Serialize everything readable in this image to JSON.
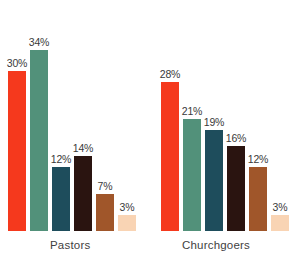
{
  "chart_data": {
    "type": "bar",
    "title": "",
    "subtitle": "",
    "xlabel": "",
    "ylabel": "",
    "ylim": [
      0,
      36
    ],
    "grid": false,
    "legend": "none",
    "categories": [
      "Pastors",
      "Churchgoers"
    ],
    "series": [
      {
        "name": "Series 1",
        "color": "#F5391D",
        "values": [
          30,
          28
        ],
        "labels": [
          "30%",
          "28%"
        ]
      },
      {
        "name": "Series 2",
        "color": "#52917A",
        "values": [
          34,
          21
        ],
        "labels": [
          "34%",
          "21%"
        ]
      },
      {
        "name": "Series 3",
        "color": "#1E4D5C",
        "values": [
          12,
          19
        ],
        "labels": [
          "12%",
          "19%"
        ]
      },
      {
        "name": "Series 4",
        "color": "#2A1410",
        "values": [
          14,
          16
        ],
        "labels": [
          "14%",
          "16%"
        ]
      },
      {
        "name": "Series 5",
        "color": "#A0562A",
        "values": [
          7,
          12
        ],
        "labels": [
          "7%",
          "12%"
        ]
      },
      {
        "name": "Series 6",
        "color": "#F9D4B4",
        "values": [
          3,
          3
        ],
        "labels": [
          "3%",
          "3%"
        ]
      }
    ],
    "groups": [
      {
        "label": "Pastors",
        "bars": [
          {
            "label": "30%",
            "value": 30,
            "color": "#F5391D"
          },
          {
            "label": "34%",
            "value": 34,
            "color": "#52917A"
          },
          {
            "label": "12%",
            "value": 12,
            "color": "#1E4D5C"
          },
          {
            "label": "14%",
            "value": 14,
            "color": "#2A1410"
          },
          {
            "label": "7%",
            "value": 7,
            "color": "#A0562A"
          },
          {
            "label": "3%",
            "value": 3,
            "color": "#F9D4B4"
          }
        ]
      },
      {
        "label": "Churchgoers",
        "bars": [
          {
            "label": "28%",
            "value": 28,
            "color": "#F5391D"
          },
          {
            "label": "21%",
            "value": 21,
            "color": "#52917A"
          },
          {
            "label": "19%",
            "value": 19,
            "color": "#1E4D5C"
          },
          {
            "label": "16%",
            "value": 16,
            "color": "#2A1410"
          },
          {
            "label": "12%",
            "value": 12,
            "color": "#A0562A"
          },
          {
            "label": "3%",
            "value": 3,
            "color": "#F9D4B4"
          }
        ]
      }
    ]
  },
  "style": {
    "background": "#FFFFFF",
    "label_color": "#3A3A3A",
    "axis_label_color": "#3F3F3F"
  }
}
